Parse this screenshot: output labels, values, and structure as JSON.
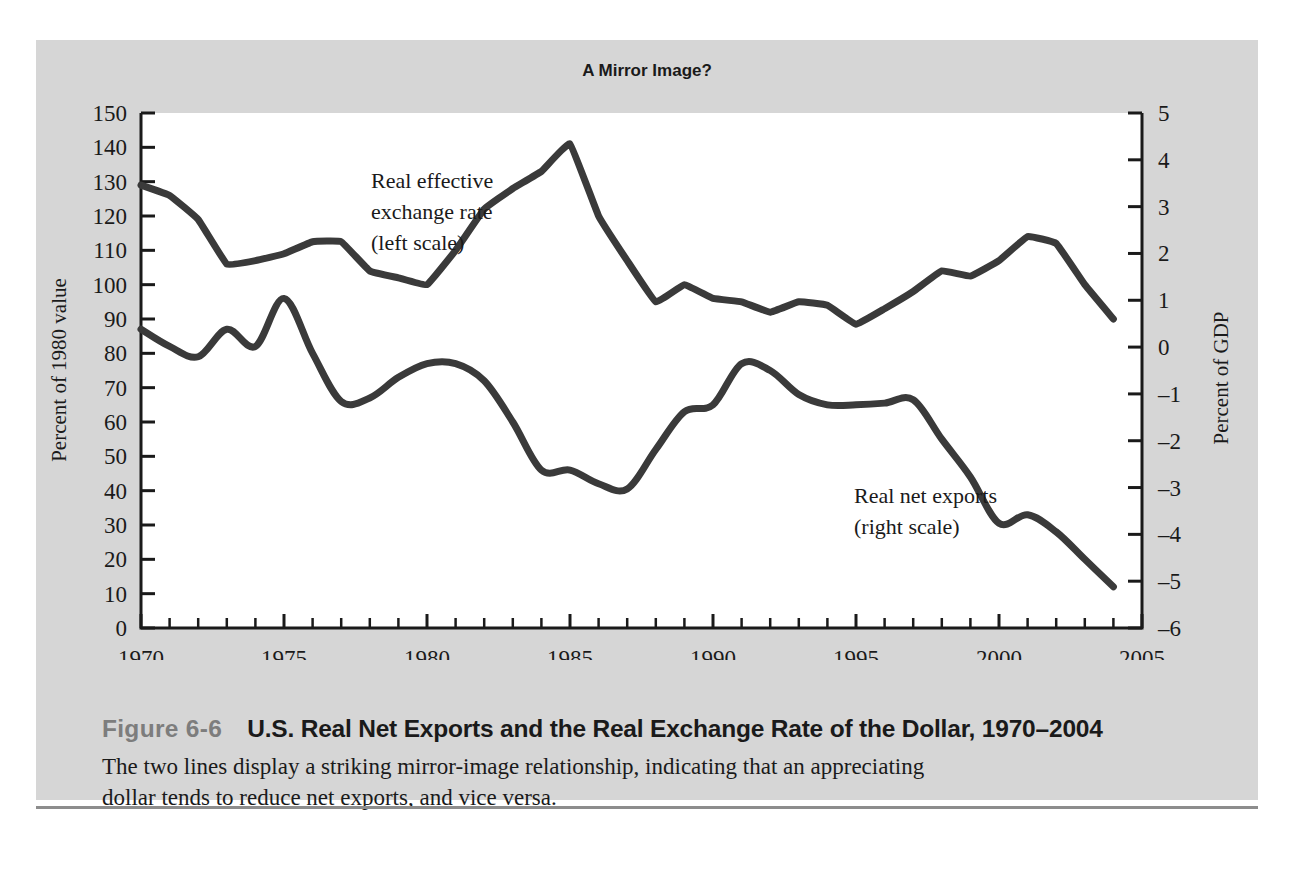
{
  "figure": {
    "number": "Figure 6-6",
    "heading": "U.S. Real Net Exports and the Real Exchange Rate of the Dollar, 1970–2004",
    "body": "The two lines display a striking mirror-image relationship, indicating that an appreciating dollar tends to reduce net exports, and vice versa."
  },
  "colors": {
    "panel_background": "#d6d6d6",
    "plot_background": "#ffffff",
    "line": "#3a3a3a",
    "axis": "#1a1a1a",
    "figure_number": "#7d7d7d",
    "rule": "#8d8d8d"
  },
  "chart_data": {
    "type": "line",
    "title": "A Mirror Image?",
    "xlabel": "",
    "ylabel": "Percent of 1980 value",
    "y2label": "Percent of GDP",
    "grid": false,
    "legend": "annotations-on-plot",
    "xlim": [
      1970,
      2005
    ],
    "ylim": [
      0,
      150
    ],
    "y2lim": [
      -6,
      5
    ],
    "xticks": [
      1970,
      1975,
      1980,
      1985,
      1990,
      1995,
      2000,
      2005
    ],
    "xtick_labels": [
      "1970",
      "1975",
      "1980",
      "1985",
      "1990",
      "1995",
      "2000",
      "2005"
    ],
    "x_minor_tick_step": 1,
    "yticks": [
      0,
      10,
      20,
      30,
      40,
      50,
      60,
      70,
      80,
      90,
      100,
      110,
      120,
      130,
      140,
      150
    ],
    "ytick_labels": [
      "0",
      "10",
      "20",
      "30",
      "40",
      "50",
      "60",
      "70",
      "80",
      "90",
      "100",
      "110",
      "120",
      "130",
      "140",
      "150"
    ],
    "y2ticks": [
      -6,
      -5,
      -4,
      -3,
      -2,
      -1,
      0,
      1,
      2,
      3,
      4,
      5
    ],
    "y2tick_labels": [
      "–6",
      "–5",
      "–4",
      "–3",
      "–2",
      "–1",
      "0",
      "1",
      "2",
      "3",
      "4",
      "5"
    ],
    "x": [
      1970,
      1971,
      1972,
      1973,
      1974,
      1975,
      1976,
      1977,
      1978,
      1979,
      1980,
      1981,
      1982,
      1983,
      1984,
      1985,
      1986,
      1987,
      1988,
      1989,
      1990,
      1991,
      1992,
      1993,
      1994,
      1995,
      1996,
      1997,
      1998,
      1999,
      2000,
      2001,
      2002,
      2003,
      2004
    ],
    "series": [
      {
        "name": "Real effective exchange rate",
        "scale": "left",
        "axis_units": "Percent of 1980 value",
        "annotation": "Real effective\nexchange rate\n(left scale)",
        "values": [
          129,
          126,
          119,
          106,
          107,
          109,
          112.5,
          112.5,
          104,
          102,
          100,
          110,
          122,
          128,
          133,
          141,
          120,
          107,
          95,
          100,
          96,
          95,
          92,
          95,
          94,
          88.5,
          93,
          98,
          104,
          102.5,
          107,
          114,
          112,
          100,
          90
        ]
      },
      {
        "name": "Real net exports",
        "scale": "right",
        "axis_units": "Percent of GDP",
        "annotation": "Real net exports\n(right scale)",
        "values_left_equivalent": [
          87,
          82,
          79,
          87,
          82,
          96,
          80,
          66,
          67,
          73,
          77,
          77,
          72,
          60,
          46,
          46,
          42,
          40.5,
          52,
          63,
          65,
          77,
          75,
          68,
          65,
          65,
          65.5,
          66.5,
          55,
          44,
          30.5,
          33,
          28,
          20,
          12
        ],
        "values": [
          0.2,
          -0.3,
          -0.6,
          0.2,
          -0.3,
          1.1,
          -0.5,
          -1.8,
          -1.7,
          -1.1,
          -0.7,
          -0.7,
          -1.2,
          -2.5,
          -3.0,
          -3.0,
          -3.4,
          -3.6,
          -2.4,
          -1.2,
          -1.0,
          0.2,
          0.0,
          -0.6,
          -1.0,
          -1.0,
          -0.9,
          -0.8,
          -1.9,
          -3.1,
          -4.6,
          -4.3,
          -4.8,
          -5.0,
          -5.1
        ]
      }
    ]
  }
}
